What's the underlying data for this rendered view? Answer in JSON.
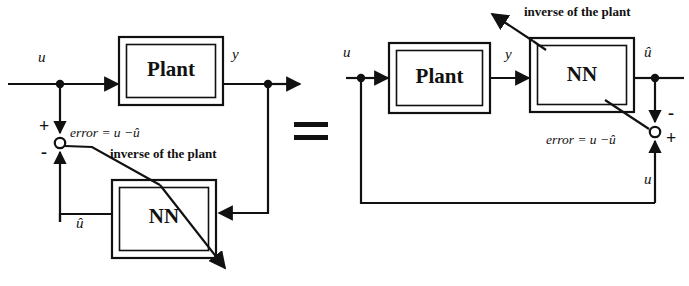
{
  "figure": {
    "type": "block-diagram",
    "ink_color": "#111111",
    "background_color": "#ffffff"
  },
  "equality": {
    "symbol": "=",
    "name": "equals-sign"
  },
  "left_diagram": {
    "name": "series-identification-structure",
    "blocks": [
      {
        "id": "plant",
        "label": "Plant"
      },
      {
        "id": "nn",
        "label": "NN"
      }
    ],
    "signals": {
      "input": "u",
      "plant_output": "y",
      "nn_output": "û"
    },
    "error_label": "error = u −û",
    "annotation": "inverse of the plant",
    "summing_junction": {
      "name": "summing-junction-left",
      "plus": "+",
      "minus": "-"
    }
  },
  "right_diagram": {
    "name": "inverse-identification-structure",
    "blocks": [
      {
        "id": "plant",
        "label": "Plant"
      },
      {
        "id": "nn",
        "label": "NN"
      }
    ],
    "signals": {
      "input": "u",
      "plant_output": "y",
      "nn_output": "û",
      "feedback": "u"
    },
    "error_label": "error = u −û",
    "annotation": "inverse of the plant",
    "summing_junction": {
      "name": "summing-junction-right",
      "plus": "+",
      "minus": "-"
    }
  }
}
